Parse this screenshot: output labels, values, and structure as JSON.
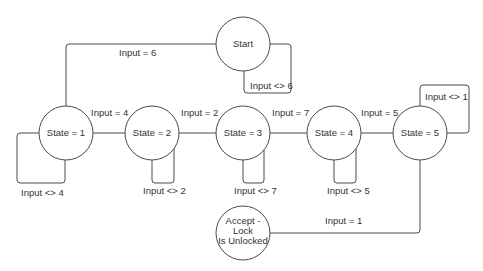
{
  "diagram": {
    "type": "state-machine",
    "nodes": [
      {
        "id": "start",
        "label": "Start"
      },
      {
        "id": "s1",
        "label": "State = 1"
      },
      {
        "id": "s2",
        "label": "State = 2"
      },
      {
        "id": "s3",
        "label": "State = 3"
      },
      {
        "id": "s4",
        "label": "State = 4"
      },
      {
        "id": "s5",
        "label": "State = 5"
      },
      {
        "id": "accept",
        "label_lines": [
          "Accept -",
          "Lock",
          "Is Unlocked"
        ]
      }
    ],
    "edges": [
      {
        "from": "start",
        "to": "s1",
        "label": "Input = 6"
      },
      {
        "from": "start",
        "to": "start",
        "label": "Input <> 6"
      },
      {
        "from": "s1",
        "to": "s2",
        "label": "Input = 4"
      },
      {
        "from": "s1",
        "to": "s1",
        "label": "Input <> 4"
      },
      {
        "from": "s2",
        "to": "s3",
        "label": "Input = 2"
      },
      {
        "from": "s2",
        "to": "s2",
        "label": "Input <> 2"
      },
      {
        "from": "s3",
        "to": "s4",
        "label": "Input = 7"
      },
      {
        "from": "s3",
        "to": "s3",
        "label": "Input <> 7"
      },
      {
        "from": "s4",
        "to": "s5",
        "label": "Input = 5"
      },
      {
        "from": "s4",
        "to": "s4",
        "label": "Input <> 5"
      },
      {
        "from": "s5",
        "to": "s5",
        "label": "Input <> 1"
      },
      {
        "from": "s5",
        "to": "accept",
        "label": "Input = 1"
      }
    ]
  }
}
